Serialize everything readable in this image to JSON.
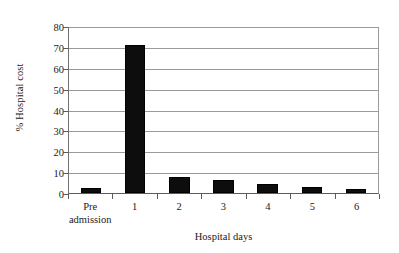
{
  "chart_data": {
    "type": "bar",
    "title": "",
    "xlabel": "Hospital days",
    "ylabel": "% Hospital cost",
    "categories": [
      "Pre admission",
      "1",
      "2",
      "3",
      "4",
      "5",
      "6"
    ],
    "category_lines": [
      [
        "Pre",
        "admission"
      ],
      [
        "1",
        ""
      ],
      [
        "2",
        ""
      ],
      [
        "3",
        ""
      ],
      [
        "4",
        ""
      ],
      [
        "5",
        ""
      ],
      [
        "6",
        ""
      ]
    ],
    "values": [
      2.2,
      71,
      7.6,
      6.0,
      4.5,
      2.7,
      1.7
    ],
    "ylim": [
      0,
      80
    ],
    "ytick_step": 10,
    "yticks": [
      "80",
      "70",
      "60",
      "50",
      "40",
      "30",
      "20",
      "10",
      "0"
    ],
    "ytick_values": [
      80,
      70,
      60,
      50,
      40,
      30,
      20,
      10,
      0
    ],
    "grid": true,
    "grid_axis": "y",
    "legend": false,
    "legend_position": "none",
    "bar_color": "#0d0d0d",
    "grid_color": "#9a9a9a",
    "axis_color": "#5c5c5c",
    "background_color": "#ffffff"
  }
}
